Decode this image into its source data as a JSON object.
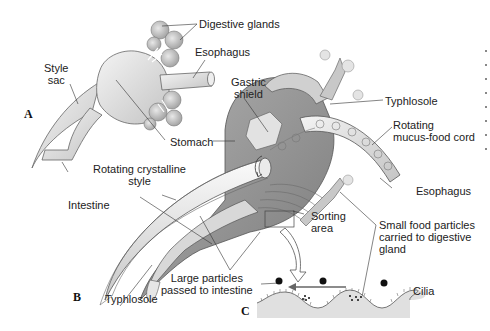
{
  "figure": {
    "panels": [
      {
        "id": "A",
        "label": "A"
      },
      {
        "id": "B",
        "label": "B"
      },
      {
        "id": "C",
        "label": "C"
      }
    ],
    "labels": {
      "digestive_glands": "Digestive glands",
      "esophagus_a": "Esophagus",
      "style_sac": "Style\nsac",
      "stomach": "Stomach",
      "gastric_shield": "Gastric\nshield",
      "typhlosole_top": "Typhlosole",
      "rotating_mucus_food_cord": "Rotating\nmucus-food cord",
      "rotating_crystalline_style": "Rotating crystalline\nstyle",
      "intestine": "Intestine",
      "esophagus_b": "Esophagus",
      "sorting_area": "Sorting\narea",
      "small_food_particles": "Small food particles\ncarried to digestive\ngland",
      "large_particles": "Large particles\npassed to intestine",
      "typhlosole_bottom": "Typhlosole",
      "cilia": "Cilia"
    },
    "colors": {
      "background": "#ffffff",
      "organ_fill": "#e6e6e6",
      "organ_shade": "#b8b8b8",
      "dark_shade": "#8c8c8c",
      "outline": "#555555",
      "leader_line": "#333333",
      "text": "#222222"
    }
  }
}
